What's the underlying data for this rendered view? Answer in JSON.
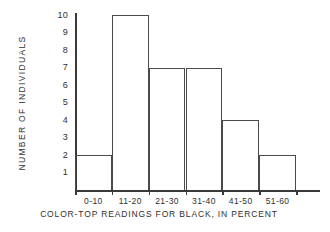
{
  "chart_data": {
    "type": "bar",
    "title": "",
    "subtitle": "",
    "categories": [
      "0-10",
      "11-20",
      "21-30",
      "31-40",
      "41-50",
      "51-60"
    ],
    "values": [
      2,
      10,
      7,
      7,
      4,
      2
    ],
    "series": [
      {
        "name": "Number of individuals",
        "values": [
          2,
          10,
          7,
          7,
          4,
          2
        ]
      }
    ],
    "xlabel": "COLOR-TOP READINGS FOR BLACK, IN PERCENT",
    "ylabel": "NUMBER  OF  INDIVIDUALS",
    "ytick_labels": [
      "10",
      "9",
      "8",
      "7",
      "6",
      "5",
      "4",
      "3",
      "2",
      "1"
    ],
    "ylim": [
      0,
      10
    ],
    "xlim_categories": 6,
    "grid": false,
    "legend": false,
    "legend_position": "none",
    "bar_style": "outline",
    "bar_fill": "#ffffff",
    "bar_edge_color": "#4a4a4a",
    "axis_color": "#3a3a3a",
    "background": "#ffffff",
    "text_color": "#2f2f2f"
  },
  "axes": {
    "y_title": "NUMBER  OF  INDIVIDUALS",
    "caption": "COLOR-TOP  READINGS  FOR  BLACK, IN  PERCENT"
  }
}
